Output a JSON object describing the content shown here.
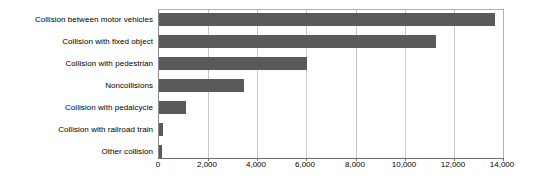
{
  "chart_data": {
    "type": "bar",
    "orientation": "horizontal",
    "title": "",
    "subtitle": "",
    "xlabel": "",
    "ylabel": "",
    "categories": [
      "Collision between motor vehicles",
      "Collision with fixed object",
      "Collision with pedestrian",
      "Noncollisions",
      "Collision with pedalcycle",
      "Collision with railroad train",
      "Other collision"
    ],
    "values": [
      13640,
      11240,
      6000,
      3450,
      1100,
      160,
      130
    ],
    "xlim": [
      0,
      14000
    ],
    "xticks": [
      0,
      2000,
      4000,
      6000,
      8000,
      10000,
      12000,
      14000
    ],
    "xticklabels": [
      "0",
      "2,000",
      "4,000",
      "6,000",
      "8,000",
      "10,000",
      "12,000",
      "14,000"
    ],
    "grid": "vertical",
    "legend": "none",
    "bar_color": "#5a5a5a",
    "gridline_color": "#c8c8c8",
    "axis_color": "#6e6e6e",
    "background_color": "#ffffff"
  }
}
